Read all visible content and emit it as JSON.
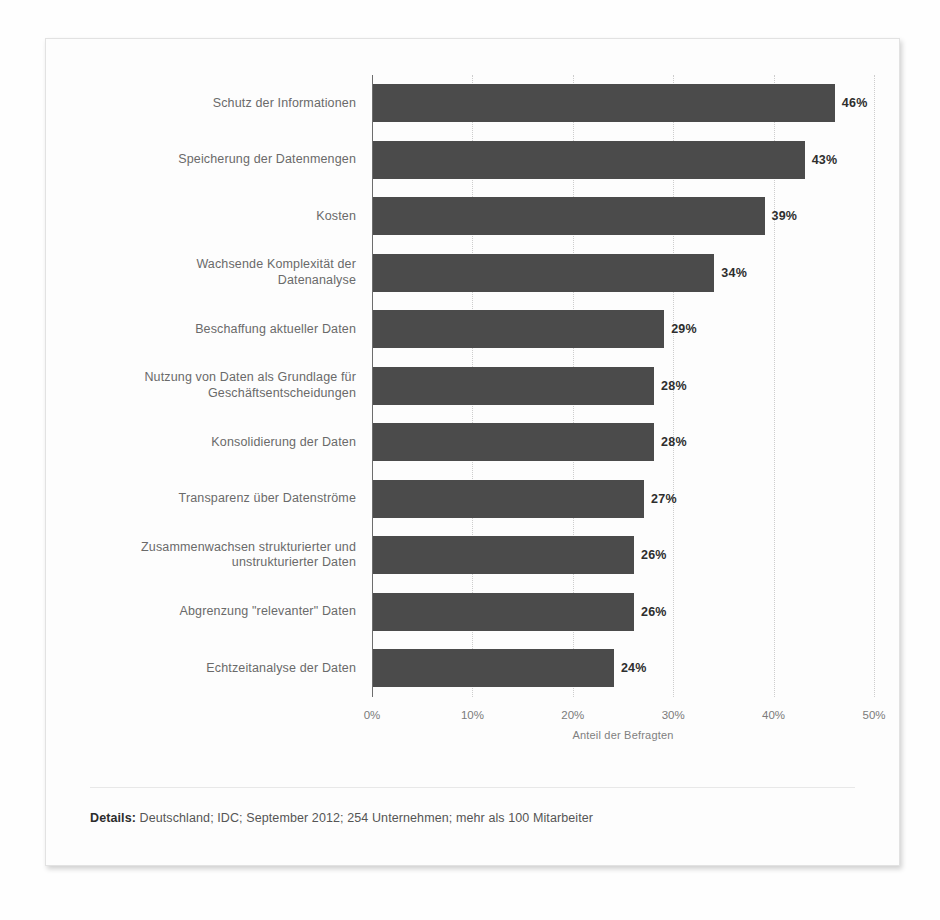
{
  "chart_data": {
    "type": "bar",
    "orientation": "horizontal",
    "title": "",
    "xlabel": "Anteil der Befragten",
    "ylabel": "",
    "xlim": [
      0,
      50
    ],
    "grid": true,
    "legend": "none",
    "unit": "%",
    "tick_labels": [
      "0%",
      "10%",
      "20%",
      "30%",
      "40%",
      "50%"
    ],
    "tick_values": [
      0,
      10,
      20,
      30,
      40,
      50
    ],
    "categories": [
      "Schutz der Informationen",
      "Speicherung der Datenmengen",
      "Kosten",
      "Wachsende Komplexität der\nDatenanalyse",
      "Beschaffung aktueller Daten",
      "Nutzung von Daten als Grundlage für\nGeschäftsentscheidungen",
      "Konsolidierung der Daten",
      "Transparenz über Datenströme",
      "Zusammenwachsen strukturierter und\nunstrukturierter Daten",
      "Abgrenzung \"relevanter\" Daten",
      "Echtzeitanalyse der Daten"
    ],
    "values": [
      46,
      43,
      39,
      34,
      29,
      28,
      28,
      27,
      26,
      26,
      24
    ],
    "value_labels": [
      "46%",
      "43%",
      "39%",
      "34%",
      "29%",
      "28%",
      "28%",
      "27%",
      "26%",
      "26%",
      "24%"
    ],
    "bar_color": "#4b4b4b",
    "grid_color": "#cdcdcd",
    "axis_color": "#6d6d6d"
  },
  "footer": {
    "details_label": "Details:",
    "details_text": " Deutschland; IDC; September 2012; 254 Unternehmen; mehr als 100 Mitarbeiter"
  },
  "caption": {
    "text": ""
  }
}
